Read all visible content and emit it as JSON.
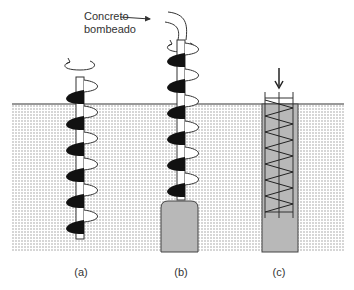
{
  "figure": {
    "callout": {
      "line1": "Concreto",
      "line2": "bombeado"
    },
    "panels": [
      {
        "id": "a",
        "label": "(a)",
        "description": "Auger drilling into soil with rotation"
      },
      {
        "id": "b",
        "label": "(b)",
        "description": "Auger withdrawn while concrete is pumped through hollow stem"
      },
      {
        "id": "c",
        "label": "(c)",
        "description": "Reinforcement cage pushed into fresh concrete pile"
      }
    ],
    "colors": {
      "soil_dots": "#9a9a9a",
      "soil_bg": "#ffffff",
      "concrete": "#b8b8b8",
      "outline": "#333333",
      "flight_dark": "#111111"
    }
  }
}
